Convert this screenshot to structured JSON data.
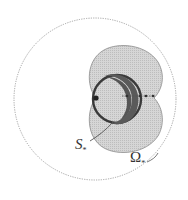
{
  "diagram": {
    "labels": {
      "s_star": {
        "main": "S",
        "sub": "*"
      },
      "omega_star": {
        "main": "Ω",
        "sub": "*"
      }
    },
    "colors": {
      "region_fill": "#d4d4d4",
      "outer_circle": "#9a9a9a",
      "inner_circle": "#3a3a3a",
      "background": "#ffffff"
    }
  }
}
